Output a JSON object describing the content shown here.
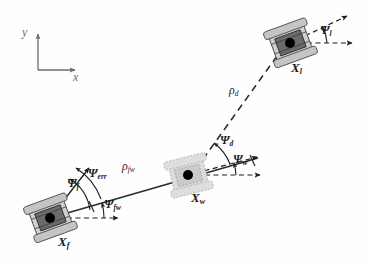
{
  "figure": {
    "type": "diagram",
    "background_color": "#fefefe",
    "ink_color": "#1c1c1c",
    "axis_color": "#6d6d6d",
    "robot_body_color": "#6b6b6b",
    "robot_wheel_color": "#bdbdbd",
    "virtual_robot_color": "#c9c9c9"
  },
  "axes": {
    "name": "world-frame-axes",
    "x_label": "x",
    "y_label": "y",
    "origin": [
      38,
      70
    ],
    "x_tip": [
      78,
      70
    ],
    "y_tip": [
      38,
      30
    ]
  },
  "robots": [
    {
      "id": "leader",
      "label": "X",
      "sublabel": "l",
      "center": [
        290,
        43
      ],
      "heading_deg": -20,
      "faded": false,
      "label_pos": [
        291,
        64
      ]
    },
    {
      "id": "virtual",
      "label": "X",
      "sublabel": "w",
      "center": [
        188,
        175
      ],
      "heading_deg": -14,
      "faded": true,
      "label_pos": [
        191,
        194
      ]
    },
    {
      "id": "follower",
      "label": "X",
      "sublabel": "f",
      "center": [
        50,
        218
      ],
      "heading_deg": -20,
      "faded": false,
      "label_pos": [
        58,
        238
      ]
    }
  ],
  "angles": [
    {
      "name": "psi-leader",
      "symbol": "Ψ",
      "sublabel": "l",
      "at_robot": "leader",
      "from": "world-x-reference",
      "to": "leader-heading",
      "label_pos": [
        320,
        26
      ]
    },
    {
      "name": "psi-desired",
      "symbol": "Ψ",
      "sublabel": "d",
      "at_robot": "virtual",
      "from": "virtual-heading",
      "to": "rho-d-line",
      "label_pos": [
        221,
        138
      ]
    },
    {
      "name": "psi-virtual",
      "symbol": "Ψ",
      "sublabel": "w",
      "at_robot": "virtual",
      "from": "world-x-reference",
      "to": "virtual-heading",
      "label_pos": [
        233,
        156
      ]
    },
    {
      "name": "psi-follower",
      "symbol": "Ψ",
      "sublabel": "f",
      "at_robot": "follower",
      "from": "world-x-reference",
      "to": "follower-heading",
      "label_pos": [
        69,
        180
      ]
    },
    {
      "name": "psi-error",
      "symbol": "Ψ",
      "sublabel": "err",
      "at_robot": "follower",
      "from": "follower-heading",
      "to": "rho-fw-line",
      "label_pos": [
        90,
        171
      ]
    },
    {
      "name": "psi-follower-to-virtual",
      "symbol": "Ψ",
      "sublabel": "fw",
      "at_robot": "follower",
      "from": "world-x-reference",
      "to": "rho-fw-line",
      "label_pos": [
        105,
        201
      ]
    }
  ],
  "distances": [
    {
      "name": "rho-desired",
      "symbol": "ρ",
      "sublabel": "d",
      "from_robot": "virtual",
      "to_robot": "leader",
      "line_style": "dashed",
      "label_pos": [
        231,
        88
      ]
    },
    {
      "name": "rho-follower-virtual",
      "symbol": "ρ",
      "sublabel": "fw",
      "from_robot": "follower",
      "to_robot": "virtual",
      "line_style": "solid",
      "label_pos": [
        124,
        164
      ]
    }
  ]
}
